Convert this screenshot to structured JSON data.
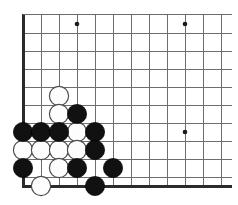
{
  "figure": {
    "kind": "go-board-diagram",
    "board_size": 19,
    "visible_region": "bottom-left corner"
  },
  "board": {
    "grid_spacing_px": 18,
    "origin_x_px": 23,
    "origin_y_px": 14,
    "left_edge_x_px": 23,
    "bottom_edge_y_px": 186,
    "columns_visible": 12,
    "rows_visible": 10,
    "line_color": "#6d6d6d",
    "edge_color": "#2b2b2b",
    "background_color": "#ffffff",
    "black_stone_color": "#111111",
    "white_stone_color": "#fdfdfd",
    "white_stone_outline_color": "#4a4a4a",
    "stone_radius_px": 9.6,
    "star_point_radius_px": 2.3
  },
  "chart_data": {
    "type": "scatter",
    "xlabel": "",
    "ylabel": "",
    "grid": true,
    "legend": "none",
    "grid_spacing_px": 18,
    "vertical_lines_x_px": [
      23,
      41,
      59,
      77,
      95,
      113,
      131,
      149,
      167,
      185,
      203,
      221
    ],
    "horizontal_lines_y_px": [
      14,
      33,
      51,
      69,
      87,
      105,
      123,
      141,
      159,
      177,
      186
    ],
    "star_points": [
      {
        "x_px": 77,
        "y_px": 24,
        "col": 3,
        "row": 0
      },
      {
        "x_px": 185,
        "y_px": 24,
        "col": 9,
        "row": 0
      },
      {
        "x_px": 185,
        "y_px": 132,
        "col": 9,
        "row": 6
      }
    ],
    "series": [
      {
        "name": "Black stones",
        "color": "#111111",
        "count": 10,
        "values": [
          {
            "x_px": 77,
            "y_px": 114,
            "col": 3,
            "row": 5
          },
          {
            "x_px": 23,
            "y_px": 132,
            "col": 0,
            "row": 6
          },
          {
            "x_px": 41,
            "y_px": 132,
            "col": 1,
            "row": 6
          },
          {
            "x_px": 59,
            "y_px": 132,
            "col": 2,
            "row": 6
          },
          {
            "x_px": 95,
            "y_px": 132,
            "col": 4,
            "row": 6
          },
          {
            "x_px": 95,
            "y_px": 150,
            "col": 4,
            "row": 7
          },
          {
            "x_px": 23,
            "y_px": 168,
            "col": 0,
            "row": 8
          },
          {
            "x_px": 77,
            "y_px": 168,
            "col": 3,
            "row": 8
          },
          {
            "x_px": 113,
            "y_px": 168,
            "col": 5,
            "row": 8
          },
          {
            "x_px": 95,
            "y_px": 186,
            "col": 4,
            "row": 9
          }
        ]
      },
      {
        "name": "White stones",
        "color": "#fdfdfd",
        "count": 9,
        "values": [
          {
            "x_px": 59,
            "y_px": 96,
            "col": 2,
            "row": 4
          },
          {
            "x_px": 59,
            "y_px": 114,
            "col": 2,
            "row": 5
          },
          {
            "x_px": 77,
            "y_px": 132,
            "col": 3,
            "row": 6
          },
          {
            "x_px": 23,
            "y_px": 150,
            "col": 0,
            "row": 7
          },
          {
            "x_px": 41,
            "y_px": 150,
            "col": 1,
            "row": 7
          },
          {
            "x_px": 59,
            "y_px": 150,
            "col": 2,
            "row": 7
          },
          {
            "x_px": 77,
            "y_px": 150,
            "col": 3,
            "row": 7
          },
          {
            "x_px": 59,
            "y_px": 168,
            "col": 2,
            "row": 8
          },
          {
            "x_px": 41,
            "y_px": 186,
            "col": 1,
            "row": 9
          }
        ]
      }
    ]
  }
}
